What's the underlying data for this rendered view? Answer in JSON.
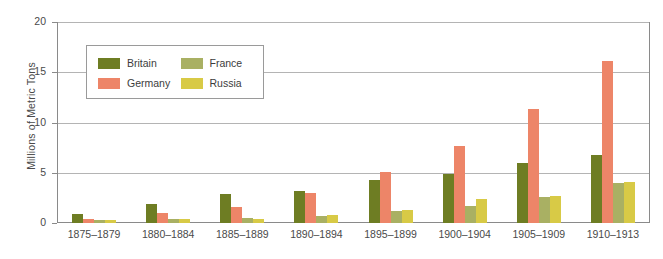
{
  "chart_data": {
    "type": "bar",
    "title": "",
    "subtitle": "",
    "xlabel": "",
    "ylabel": "Millions of Metric Tons",
    "ylim": [
      0,
      20
    ],
    "yticks": [
      0,
      5,
      10,
      15,
      20
    ],
    "ytick_labels": [
      "0",
      "5",
      "10",
      "15",
      "20"
    ],
    "grid": true,
    "legend_position": "top-left-inside",
    "categories": [
      "1875–1879",
      "1880–1884",
      "1885–1889",
      "1890–1894",
      "1895–1899",
      "1900–1904",
      "1905–1909",
      "1910–1913"
    ],
    "series": [
      {
        "name": "Britain",
        "color": "#6E7D23",
        "values": [
          0.9,
          1.9,
          2.9,
          3.2,
          4.3,
          4.9,
          6.0,
          6.8
        ]
      },
      {
        "name": "Germany",
        "color": "#ED8568",
        "values": [
          0.4,
          1.0,
          1.6,
          3.0,
          5.1,
          7.7,
          11.3,
          16.1
        ]
      },
      {
        "name": "France",
        "color": "#A9B063",
        "values": [
          0.3,
          0.4,
          0.45,
          0.7,
          1.2,
          1.7,
          2.6,
          4.0
        ]
      },
      {
        "name": "Russia",
        "color": "#D8CA46",
        "values": [
          0.3,
          0.4,
          0.4,
          0.75,
          1.3,
          2.35,
          2.65,
          4.05
        ]
      }
    ]
  },
  "legend": {
    "items": [
      {
        "label": "Britain",
        "color": "#6E7D23"
      },
      {
        "label": "France",
        "color": "#A9B063"
      },
      {
        "label": "Germany",
        "color": "#ED8568"
      },
      {
        "label": "Russia",
        "color": "#D8CA46"
      }
    ]
  },
  "axis": {
    "line_color": "#8a8a8a",
    "grid_color": "#b4b4b4",
    "text_color": "#4a4a4a"
  }
}
